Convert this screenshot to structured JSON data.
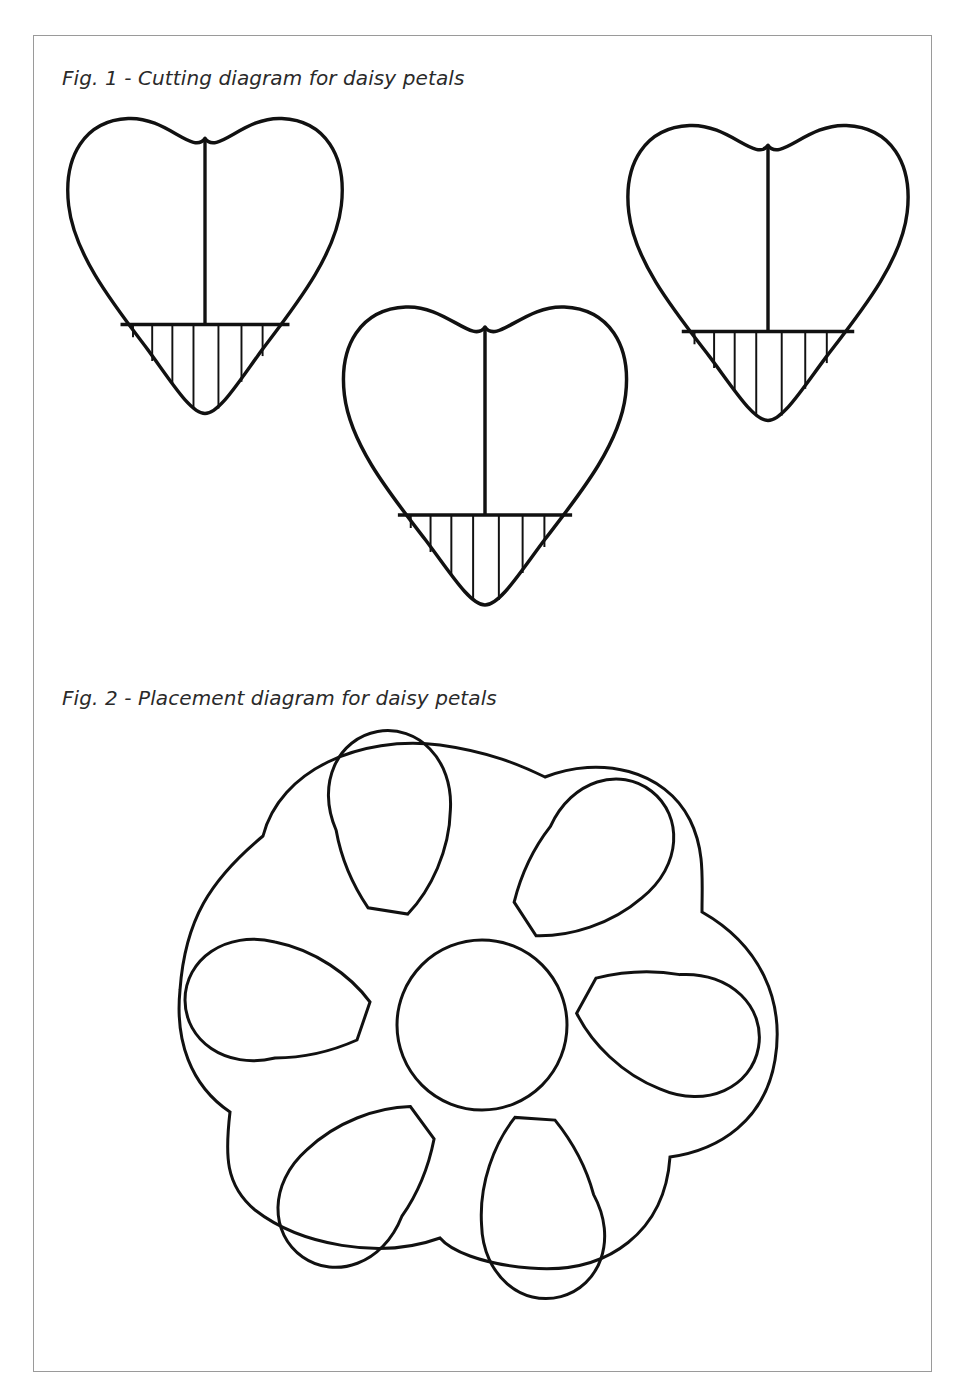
{
  "figures": [
    {
      "caption": "Fig. 1 - Cutting diagram for daisy petals",
      "items": [
        {
          "shape": "heart",
          "label": "heart-petal-left",
          "center_line": true,
          "hatched_bottom": true
        },
        {
          "shape": "heart",
          "label": "heart-petal-middle",
          "center_line": true,
          "hatched_bottom": true
        },
        {
          "shape": "heart",
          "label": "heart-petal-right",
          "center_line": true,
          "hatched_bottom": true
        }
      ]
    },
    {
      "caption": "Fig. 2 - Placement diagram for daisy petals",
      "items": [
        {
          "shape": "scalloped-outline",
          "label": "flower-outline"
        },
        {
          "shape": "circle",
          "label": "flower-center"
        },
        {
          "shape": "petal",
          "count": 6,
          "label": "daisy-petals"
        }
      ]
    }
  ],
  "colors": {
    "line": "#111111",
    "frame": "#9a9a9a",
    "background": "#ffffff"
  }
}
